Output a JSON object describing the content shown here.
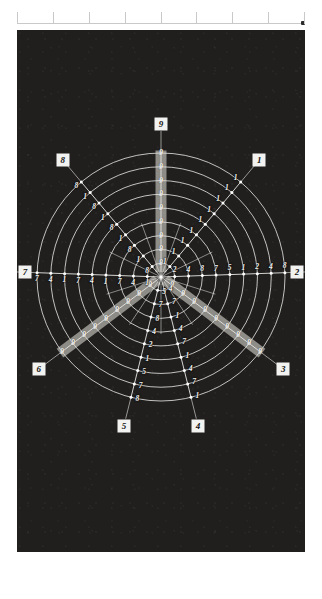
{
  "page": {
    "background": "#ffffff",
    "panel_color": "#201f1e",
    "accent_color": "#f2f2f0",
    "band_color": "#b9b7b0"
  },
  "ruler": {
    "name": "top-ruler",
    "tick_count": 9,
    "endcap_label": ""
  },
  "chart_data": {
    "type": "radar",
    "title": "",
    "subtitle": "",
    "xlabel": "",
    "ylabel": "",
    "grid": true,
    "legend": "none",
    "ring_count": 9,
    "axis_count": 8,
    "center": {
      "x": 144,
      "y": 247
    },
    "max_radius": 124,
    "categories": [
      "1",
      "2",
      "3",
      "4",
      "5",
      "6",
      "7",
      "8",
      "9"
    ],
    "axes": [
      {
        "id": "9",
        "label": "9",
        "angle_deg": -90,
        "highlighted": true,
        "tick_labels": [
          "9",
          "9",
          "9",
          "9",
          "9",
          "9",
          "9",
          "9",
          "9"
        ]
      },
      {
        "id": "1",
        "label": "1",
        "angle_deg": -50,
        "highlighted": false,
        "tick_labels": [
          "1",
          "1",
          "1",
          "1",
          "1",
          "1",
          "1",
          "1",
          "1"
        ]
      },
      {
        "id": "2",
        "label": "2",
        "angle_deg": -2,
        "highlighted": false,
        "tick_labels": [
          "2",
          "4",
          "8",
          "7",
          "5",
          "1",
          "2",
          "4",
          "8"
        ]
      },
      {
        "id": "3",
        "label": "3",
        "angle_deg": 37,
        "highlighted": true,
        "tick_labels": [
          "9",
          "9",
          "9",
          "9",
          "9",
          "9",
          "9",
          "9",
          "9"
        ]
      },
      {
        "id": "4",
        "label": "4",
        "angle_deg": 76,
        "highlighted": false,
        "tick_labels": [
          "4",
          "7",
          "1",
          "4",
          "7",
          "1",
          "4",
          "7",
          "1"
        ]
      },
      {
        "id": "5",
        "label": "5",
        "angle_deg": 104,
        "highlighted": false,
        "tick_labels": [
          "5",
          "7",
          "8",
          "4",
          "2",
          "1",
          "5",
          "7",
          "8"
        ]
      },
      {
        "id": "6",
        "label": "6",
        "angle_deg": 143,
        "highlighted": true,
        "tick_labels": [
          "9",
          "9",
          "9",
          "9",
          "9",
          "9",
          "9",
          "9",
          "9"
        ]
      },
      {
        "id": "7",
        "label": "7",
        "angle_deg": 182,
        "highlighted": false,
        "tick_labels": [
          "1",
          "4",
          "7",
          "1",
          "4",
          "7",
          "1",
          "4",
          "7"
        ]
      },
      {
        "id": "8",
        "label": "8",
        "angle_deg": -130,
        "highlighted": false,
        "tick_labels": [
          "8",
          "1",
          "8",
          "1",
          "8",
          "1",
          "8",
          "1",
          "8"
        ]
      }
    ]
  }
}
